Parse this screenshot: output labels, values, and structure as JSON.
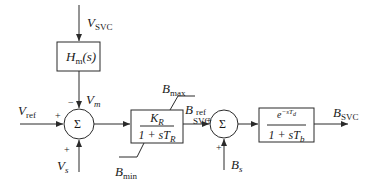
{
  "diagram": {
    "type": "block-diagram",
    "signals": {
      "v_svc": {
        "main": "V",
        "sub": "SVC"
      },
      "v_ref": {
        "main": "V",
        "sub": "ref"
      },
      "v_m": {
        "main": "V",
        "sub": "m"
      },
      "v_s": {
        "main": "V",
        "sub": "s"
      },
      "b_max": {
        "main": "B",
        "sub": "max"
      },
      "b_min": {
        "main": "B",
        "sub": "min"
      },
      "b_svc_ref": {
        "main": "B",
        "sub": "SVC",
        "sup": "ref"
      },
      "b_s": {
        "main": "B",
        "sub": "s"
      },
      "b_svc_out": {
        "main": "B",
        "sub": "SVC"
      }
    },
    "blocks": {
      "measurement": {
        "text": "H",
        "sub": "m",
        "suffix": "(s)"
      },
      "regulator": {
        "num_main": "K",
        "num_sub": "R",
        "den_prefix": "1 + sT",
        "den_sub": "R"
      },
      "delay": {
        "num_prefix": "e",
        "num_sup": "−sT",
        "num_sup_sub": "d",
        "den_prefix": "1 + sT",
        "den_sub": "b"
      }
    },
    "summers": {
      "sum1": {
        "symbol": "Σ",
        "signs": {
          "top": "−",
          "left": "+",
          "bottom": "+"
        }
      },
      "sum2": {
        "symbol": "Σ",
        "signs": {
          "left": "+",
          "bottom": "+"
        }
      }
    },
    "colors": {
      "line": "#2a2a2a",
      "background": "#ffffff"
    }
  }
}
